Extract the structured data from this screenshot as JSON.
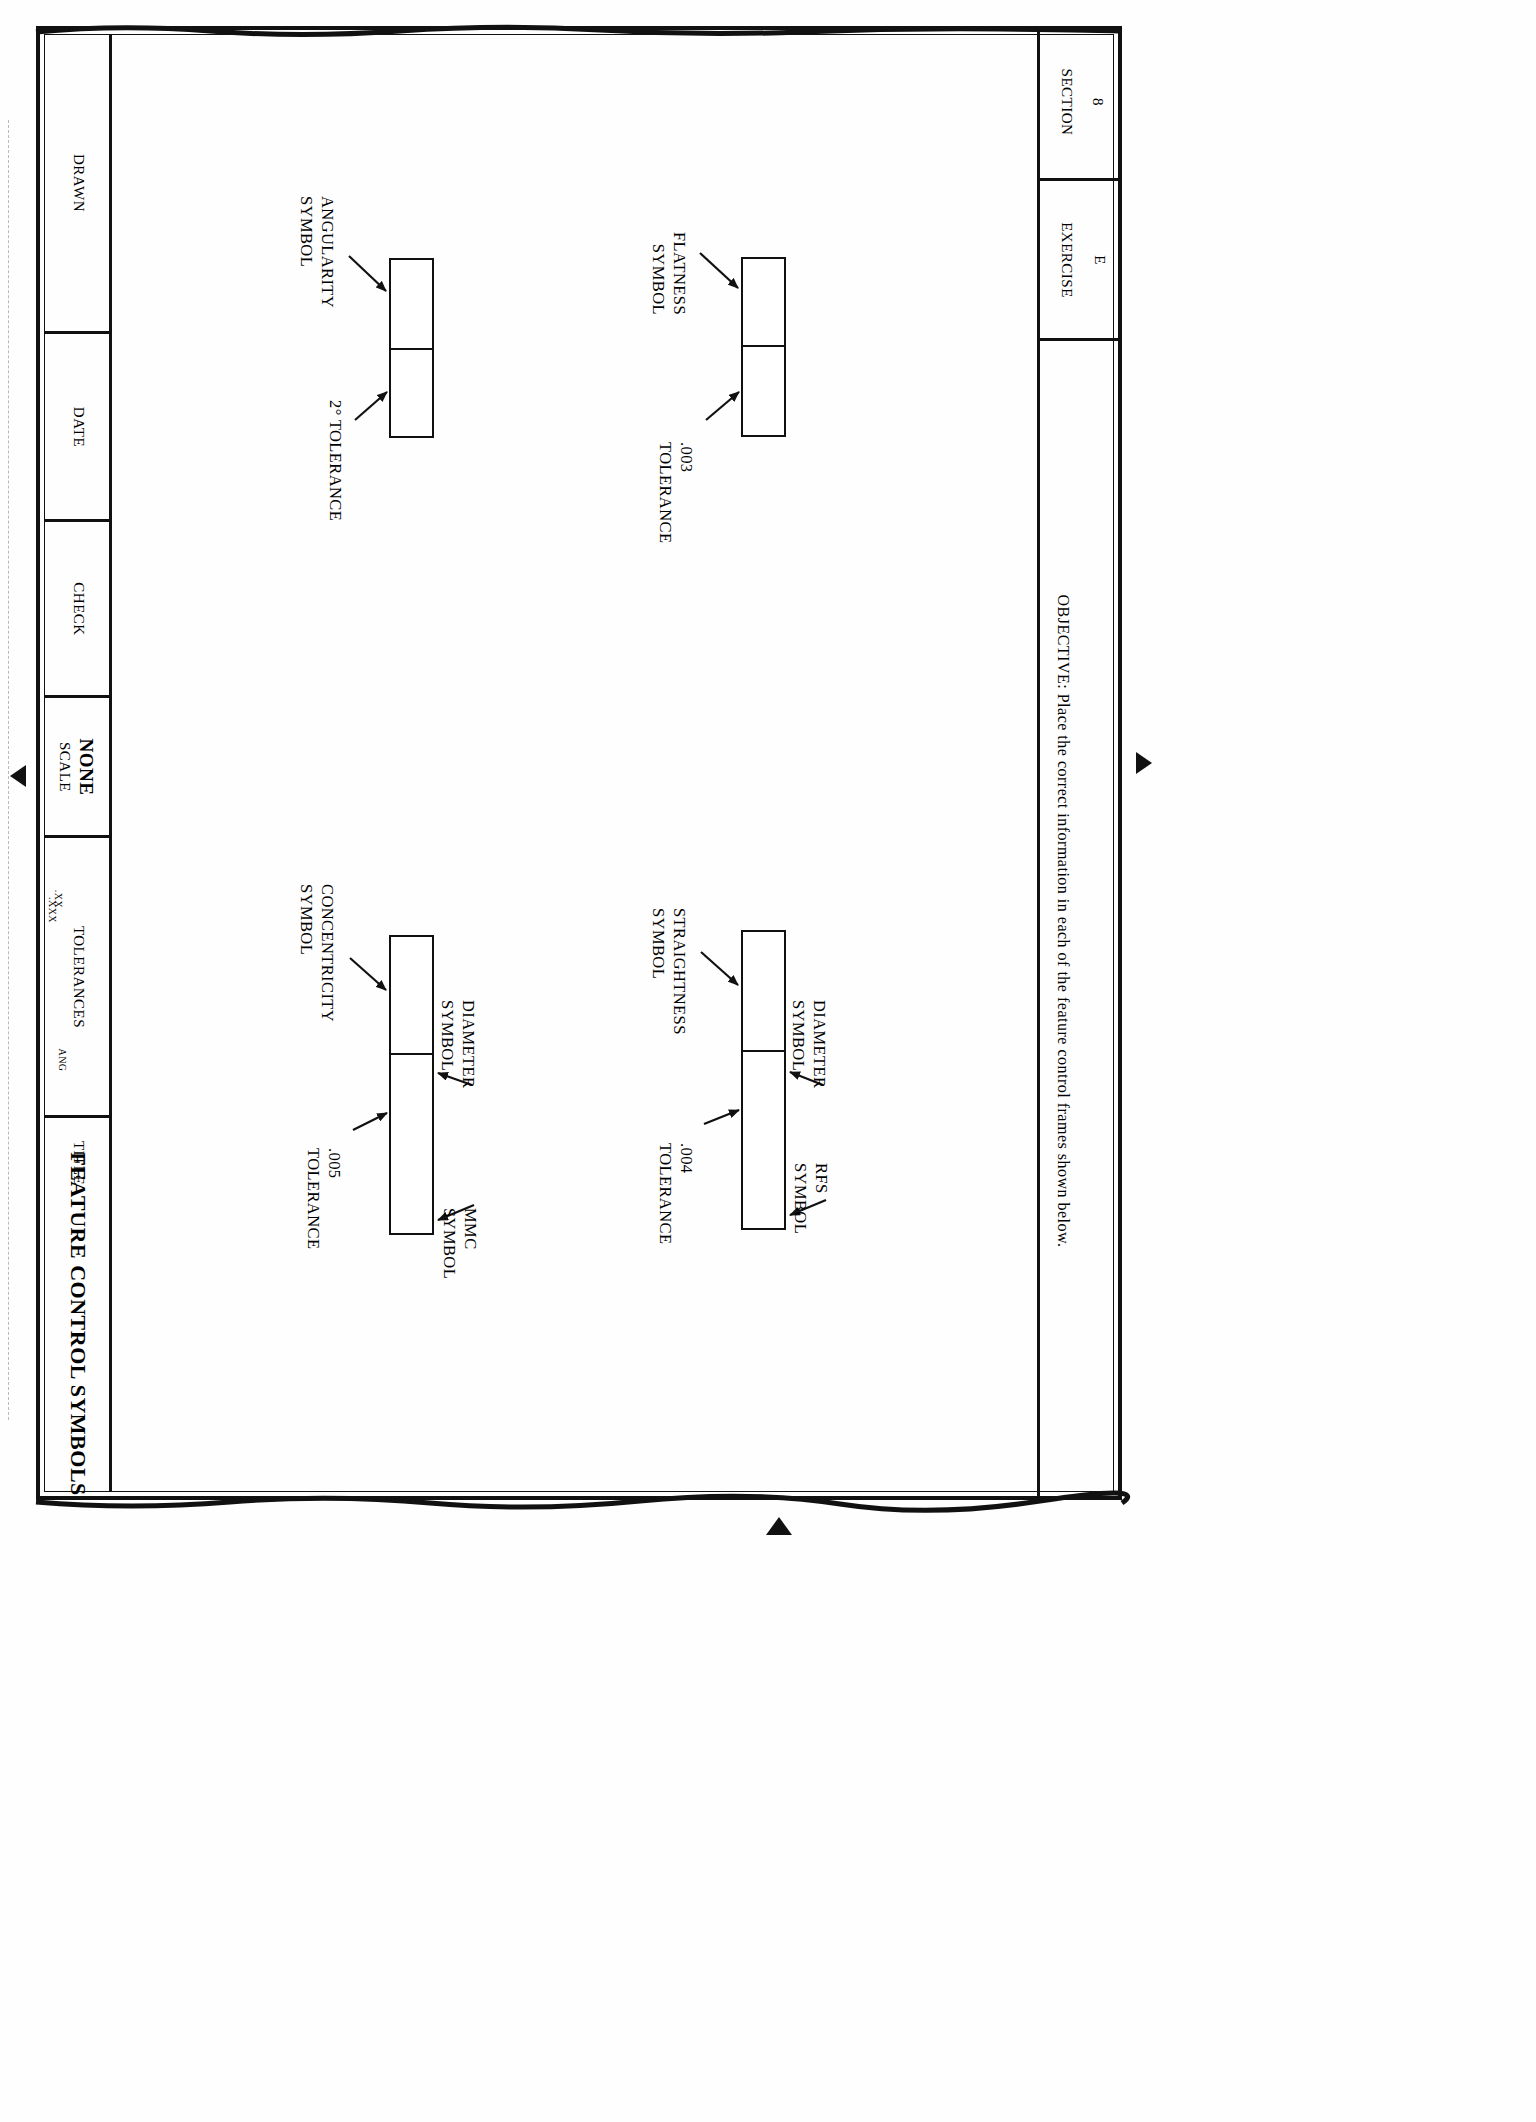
{
  "sheet": {
    "header": {
      "section_label": "SECTION",
      "section_value": "8",
      "exercise_label": "EXERCISE",
      "exercise_value": "E",
      "objective": "OBJECTIVE: Place the correct information in each of the feature control frames shown below."
    },
    "title_block": {
      "drawn_label": "DRAWN",
      "date_label": "DATE",
      "check_label": "CHECK",
      "scale_label": "SCALE",
      "scale_value": "NONE",
      "tolerances_label": "TOLERANCES",
      "tolerance_xx": ".XX",
      "tolerance_xxx": ".XXX",
      "tolerance_ang": "ANG",
      "title_label": "TITLE",
      "title_value": "FEATURE CONTROL SYMBOLS"
    },
    "frames": [
      {
        "id": "flatness",
        "callouts": [
          {
            "name": "flatness-symbol-callout",
            "text": "FLATNESS\nSYMBOL"
          },
          {
            "name": "flatness-tolerance-callout",
            "text": ".003\nTOLERANCE"
          }
        ]
      },
      {
        "id": "angularity",
        "callouts": [
          {
            "name": "angularity-symbol-callout",
            "text": "ANGULARITY\nSYMBOL"
          },
          {
            "name": "angularity-tolerance-callout",
            "text": "2° TOLERANCE"
          }
        ]
      },
      {
        "id": "straightness",
        "callouts": [
          {
            "name": "straightness-symbol-callout",
            "text": "STRAIGHTNESS\nSYMBOL"
          },
          {
            "name": "straightness-diameter-callout",
            "text": "DIAMETER\nSYMBOL"
          },
          {
            "name": "straightness-tolerance-callout",
            "text": ".004\nTOLERANCE"
          },
          {
            "name": "straightness-rfs-callout",
            "text": "RFS\nSYMBOL"
          }
        ]
      },
      {
        "id": "concentricity",
        "callouts": [
          {
            "name": "concentricity-symbol-callout",
            "text": "CONCENTRICITY\nSYMBOL"
          },
          {
            "name": "concentricity-diameter-callout",
            "text": "DIAMETER\nSYMBOL"
          },
          {
            "name": "concentricity-tolerance-callout",
            "text": ".005\nTOLERANCE"
          },
          {
            "name": "concentricity-mmc-callout",
            "text": "MMC\nSYMBOL"
          }
        ]
      }
    ],
    "callout_text": {
      "flatness_symbol_l1": "FLATNESS",
      "flatness_symbol_l2": "SYMBOL",
      "flatness_tol_l1": ".003",
      "flatness_tol_l2": "TOLERANCE",
      "angularity_symbol_l1": "ANGULARITY",
      "angularity_symbol_l2": "SYMBOL",
      "angularity_tol": "2° TOLERANCE",
      "straightness_symbol_l1": "STRAIGHTNESS",
      "straightness_symbol_l2": "SYMBOL",
      "straightness_dia_l1": "DIAMETER",
      "straightness_dia_l2": "SYMBOL",
      "straightness_tol_l1": ".004",
      "straightness_tol_l2": "TOLERANCE",
      "straightness_rfs_l1": "RFS",
      "straightness_rfs_l2": "SYMBOL",
      "concentricity_symbol_l1": "CONCENTRICITY",
      "concentricity_symbol_l2": "SYMBOL",
      "concentricity_dia_l1": "DIAMETER",
      "concentricity_dia_l2": "SYMBOL",
      "concentricity_tol_l1": ".005",
      "concentricity_tol_l2": "TOLERANCE",
      "concentricity_mmc_l1": "MMC",
      "concentricity_mmc_l2": "SYMBOL"
    },
    "colors": {
      "ink": "#111111",
      "paper": "#FEFEFE"
    }
  }
}
